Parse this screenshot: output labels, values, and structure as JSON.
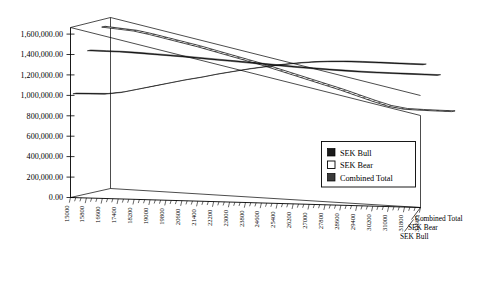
{
  "chart_data": {
    "type": "line",
    "title": "",
    "subtitle": "",
    "xlabel": "",
    "ylabel": "",
    "projection": "3d",
    "grid": false,
    "legend_position": "inside-right",
    "ylim": [
      0,
      1600000
    ],
    "ytick_labels": [
      "0.00",
      "200,000.00",
      "400,000.00",
      "600,000.00",
      "800,000.00",
      "1,000,000.00",
      "1,200,000.00",
      "1,400,000.00",
      "1,600,000.00"
    ],
    "ytick_values": [
      0,
      200000,
      400000,
      600000,
      800000,
      1000000,
      1200000,
      1400000,
      1600000
    ],
    "categories": [
      "15000",
      "15800",
      "16600",
      "17400",
      "18200",
      "19000",
      "19800",
      "20600",
      "21400",
      "22200",
      "23000",
      "23800",
      "24600",
      "25400",
      "26200",
      "27000",
      "27800",
      "28600",
      "29400",
      "30200",
      "31000",
      "31800",
      "32600"
    ],
    "depth_axis_labels": [
      "Combined Total",
      "SEK Bear",
      "SEK Bull"
    ],
    "series": [
      {
        "name": "SEK Bull",
        "style": "solid-black",
        "values": [
          1010000,
          1012000,
          1015000,
          1035000,
          1070000,
          1105000,
          1140000,
          1175000,
          1205000,
          1240000,
          1270000,
          1300000,
          1325000,
          1350000,
          1370000,
          1385000,
          1395000,
          1400000,
          1400000,
          1398000,
          1396000,
          1394000,
          1392000
        ]
      },
      {
        "name": "SEK Bear",
        "style": "hatched-open",
        "values": [
          1600000,
          1585000,
          1570000,
          1540000,
          1505000,
          1470000,
          1435000,
          1395000,
          1355000,
          1315000,
          1275000,
          1230000,
          1185000,
          1140000,
          1095000,
          1050000,
          1000000,
          950000,
          905000,
          880000,
          875000,
          872000,
          870000
        ]
      },
      {
        "name": "Combined Total",
        "style": "dark-gray",
        "values": [
          1400000,
          1398000,
          1396000,
          1390000,
          1382000,
          1374000,
          1366000,
          1356000,
          1346000,
          1336000,
          1326000,
          1316000,
          1306000,
          1296000,
          1288000,
          1280000,
          1274000,
          1268000,
          1264000,
          1262000,
          1260000,
          1258000,
          1256000
        ]
      }
    ]
  },
  "legend": {
    "items": [
      {
        "label": "SEK Bull",
        "swatch": "solid-black"
      },
      {
        "label": "SEK Bear",
        "swatch": "open-white"
      },
      {
        "label": "Combined Total",
        "swatch": "dark-gray"
      }
    ]
  }
}
